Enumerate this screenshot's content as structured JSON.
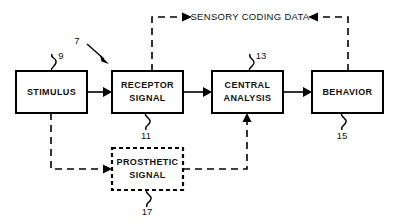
{
  "figure": {
    "type": "patent-block-diagram",
    "background_color": "#ffffff",
    "line_color": "#000000",
    "banner": {
      "label": "SENSORY CODING DATA",
      "reference_numeral": "7"
    },
    "blocks": [
      {
        "id": "stimulus",
        "line1": "STIMULUS",
        "line2": "",
        "reference_numeral": "9",
        "border_style": "solid"
      },
      {
        "id": "receptor-signal",
        "line1": "RECEPTOR",
        "line2": "SIGNAL",
        "reference_numeral": "11",
        "border_style": "solid"
      },
      {
        "id": "central-analysis",
        "line1": "CENTRAL",
        "line2": "ANALYSIS",
        "reference_numeral": "13",
        "border_style": "solid"
      },
      {
        "id": "behavior",
        "line1": "BEHAVIOR",
        "line2": "",
        "reference_numeral": "15",
        "border_style": "solid"
      },
      {
        "id": "prosthetic-signal",
        "line1": "PROSTHETIC",
        "line2": "SIGNAL",
        "reference_numeral": "17",
        "border_style": "dashed"
      }
    ]
  }
}
